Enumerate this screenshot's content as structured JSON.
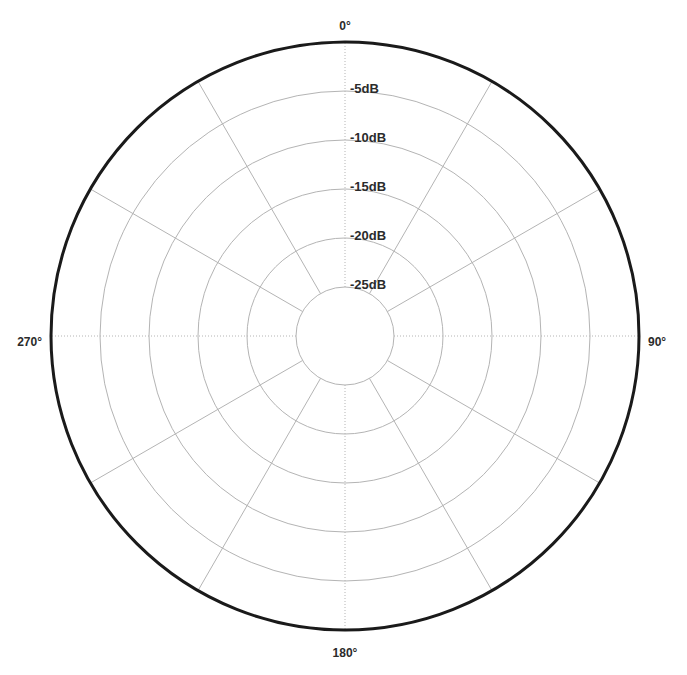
{
  "chart_data": {
    "type": "line",
    "subtype": "polar-grid",
    "title": "",
    "subtitle": "",
    "xlabel": "",
    "ylabel": "",
    "grid": true,
    "legend": null,
    "legend_position": "none",
    "series": [],
    "angular_axis": {
      "unit": "degrees",
      "range": [
        0,
        360
      ],
      "direction": "clockwise",
      "zero_location": "top",
      "spoke_interval_deg": 30,
      "spoke_angles_deg": [
        0,
        30,
        60,
        90,
        120,
        150,
        180,
        210,
        240,
        270,
        300,
        330
      ],
      "tick_labels": [
        "0°",
        "90°",
        "180°",
        "270°"
      ],
      "tick_label_angles_deg": [
        0,
        90,
        180,
        270
      ]
    },
    "radial_axis": {
      "unit": "dB",
      "range": [
        -30,
        0
      ],
      "tick_values": [
        -5,
        -10,
        -15,
        -20,
        -25
      ],
      "tick_labels": [
        "-5dB",
        "-10dB",
        "-15dB",
        "-20dB",
        "-25dB"
      ],
      "inner_ring_value": -30,
      "inner_ring_labeled": false,
      "outer_ring_value": 0,
      "outer_ring_labeled": false,
      "label_angle_deg": 0
    },
    "geometry": {
      "center_x": 345,
      "center_y": 336,
      "outer_radius": 294,
      "inner_radius": 49,
      "ring_radii": [
        294,
        245,
        196,
        147,
        98,
        49
      ]
    },
    "colors": {
      "background": "#ffffff",
      "outer_ring": "#1a1a1a",
      "grid": "#b4b4b4",
      "text": "#2b2b2b"
    }
  },
  "radial_labels": [
    {
      "text": "-5dB",
      "x": 350,
      "y": 93
    },
    {
      "text": "-10dB",
      "x": 350,
      "y": 142
    },
    {
      "text": "-15dB",
      "x": 350,
      "y": 191
    },
    {
      "text": "-20dB",
      "x": 350,
      "y": 240
    },
    {
      "text": "-25dB",
      "x": 350,
      "y": 289
    }
  ],
  "angular_labels": [
    {
      "text": "0°",
      "x": 345,
      "y": 30,
      "anchor": "middle"
    },
    {
      "text": "90°",
      "x": 648,
      "y": 346,
      "anchor": "start"
    },
    {
      "text": "180°",
      "x": 345,
      "y": 657,
      "anchor": "middle"
    },
    {
      "text": "270°",
      "x": 42,
      "y": 346,
      "anchor": "end"
    }
  ]
}
